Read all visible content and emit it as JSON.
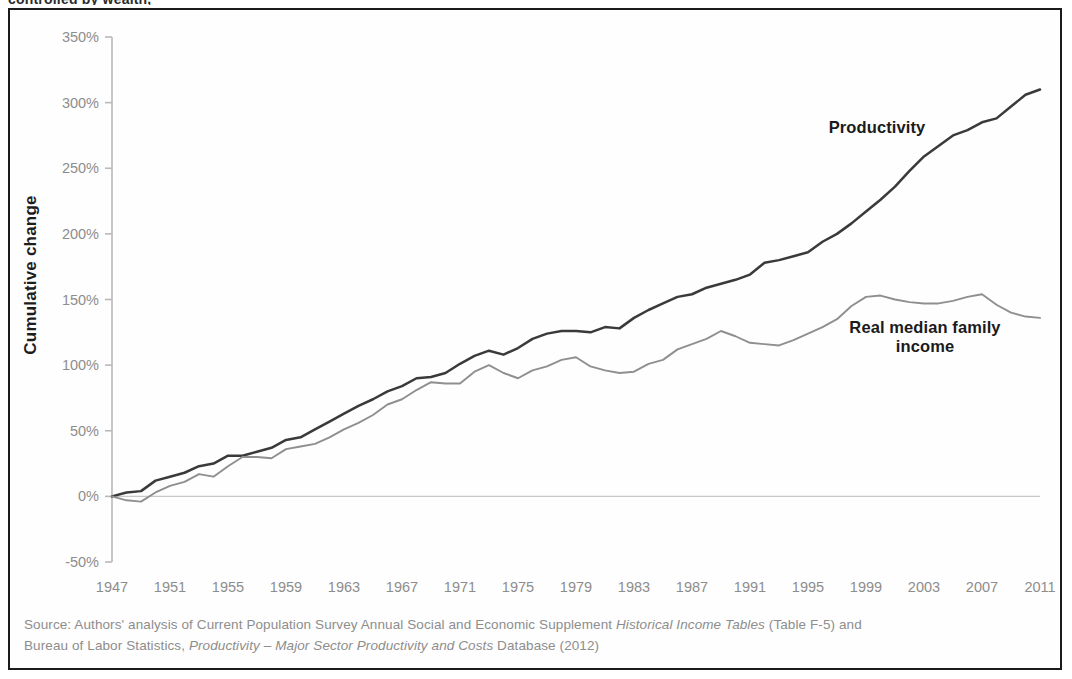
{
  "figure": {
    "clipped_top_caption": "controlled by wealth,",
    "y_axis_title": "Cumulative change",
    "source_line1_prefix": "Source:  Authors' analysis of Current Population Survey Annual Social and Economic Supplement ",
    "source_line1_italic": "Historical Income Tables",
    "source_line1_suffix": " (Table F-5) and",
    "source_line2_prefix": "Bureau of Labor Statistics, ",
    "source_line2_italic": "Productivity – Major Sector Productivity and Costs",
    "source_line2_suffix": " Database (2012)"
  },
  "colors": {
    "productivity_line": "#3a3a3a",
    "income_line": "#8f8f8f",
    "axis": "#b9b9b9",
    "frame": "#1b1b1b",
    "tick_label": "#8d8d8d",
    "title_text": "#1d1d1d",
    "source_text": "#8d8d8d"
  },
  "chart_data": {
    "type": "line",
    "title": "",
    "subtitle": "",
    "xlabel": "",
    "ylabel": "Cumulative change",
    "xlim": [
      1947,
      2011
    ],
    "ylim": [
      -50,
      350
    ],
    "y_tick_labels": [
      "350%",
      "300%",
      "250%",
      "200%",
      "150%",
      "100%",
      "50%",
      "0%",
      "-50%"
    ],
    "y_ticks": [
      350,
      300,
      250,
      200,
      150,
      100,
      50,
      0,
      -50
    ],
    "x_tick_labels": [
      "1947",
      "1951",
      "1955",
      "1959",
      "1963",
      "1967",
      "1971",
      "1975",
      "1979",
      "1983",
      "1987",
      "1991",
      "1995",
      "1999",
      "2003",
      "2007",
      "2011"
    ],
    "x_ticks": [
      1947,
      1951,
      1955,
      1959,
      1963,
      1967,
      1971,
      1975,
      1979,
      1983,
      1987,
      1991,
      1995,
      1999,
      2003,
      2007,
      2011
    ],
    "grid": false,
    "zero_line": true,
    "legend_position": "inline-annotations",
    "annotations": [
      {
        "text": "Productivity",
        "series": "Productivity",
        "x": 1994,
        "y": 270
      },
      {
        "text": "Real median family income",
        "series": "Real median family income",
        "x": 2001,
        "y": 128
      }
    ],
    "x": [
      1947,
      1948,
      1949,
      1950,
      1951,
      1952,
      1953,
      1954,
      1955,
      1956,
      1957,
      1958,
      1959,
      1960,
      1961,
      1962,
      1963,
      1964,
      1965,
      1966,
      1967,
      1968,
      1969,
      1970,
      1971,
      1972,
      1973,
      1974,
      1975,
      1976,
      1977,
      1978,
      1979,
      1980,
      1981,
      1982,
      1983,
      1984,
      1985,
      1986,
      1987,
      1988,
      1989,
      1990,
      1991,
      1992,
      1993,
      1994,
      1995,
      1996,
      1997,
      1998,
      1999,
      2000,
      2001,
      2002,
      2003,
      2004,
      2005,
      2006,
      2007,
      2008,
      2009,
      2010,
      2011
    ],
    "series": [
      {
        "name": "Productivity",
        "color": "#3a3a3a",
        "values": [
          0,
          3,
          4,
          12,
          15,
          18,
          23,
          25,
          31,
          31,
          34,
          37,
          43,
          45,
          51,
          57,
          63,
          69,
          74,
          80,
          84,
          90,
          91,
          94,
          101,
          107,
          111,
          108,
          113,
          120,
          124,
          126,
          126,
          125,
          129,
          128,
          136,
          142,
          147,
          152,
          154,
          159,
          162,
          165,
          169,
          178,
          180,
          183,
          186,
          194,
          200,
          208,
          217,
          226,
          236,
          248,
          259,
          267,
          275,
          279,
          285,
          288,
          297,
          306,
          310
        ]
      },
      {
        "name": "Real median family income",
        "color": "#8f8f8f",
        "values": [
          0,
          -3,
          -4,
          3,
          8,
          11,
          17,
          15,
          23,
          30,
          30,
          29,
          36,
          38,
          40,
          45,
          51,
          56,
          62,
          70,
          74,
          81,
          87,
          86,
          86,
          95,
          100,
          94,
          90,
          96,
          99,
          104,
          106,
          99,
          96,
          94,
          95,
          101,
          104,
          112,
          116,
          120,
          126,
          122,
          117,
          116,
          115,
          119,
          124,
          129,
          135,
          145,
          152,
          153,
          150,
          148,
          147,
          147,
          149,
          152,
          154,
          146,
          140,
          137,
          136
        ]
      }
    ]
  }
}
